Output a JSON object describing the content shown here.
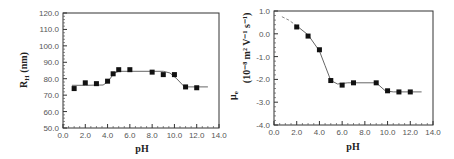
{
  "chart_data": [
    {
      "type": "scatter",
      "title": "",
      "xlabel": "pH",
      "ylabel": "R_H (nm)",
      "xlim": [
        0.0,
        14.0
      ],
      "ylim": [
        50.0,
        120.0
      ],
      "xticks": [
        "0.0",
        "2.0",
        "4.0",
        "6.0",
        "8.0",
        "10.0",
        "12.0",
        "14.0"
      ],
      "yticks": [
        "50.0",
        "60.0",
        "70.0",
        "80.0",
        "90.0",
        "100.0",
        "110.0",
        "120.0"
      ],
      "grid": false,
      "legend": null,
      "series": [
        {
          "name": "data",
          "marker": "filled-square",
          "x": [
            1.0,
            2.0,
            3.0,
            4.0,
            4.5,
            5.0,
            6.0,
            8.0,
            9.0,
            10.0,
            11.0,
            12.0
          ],
          "y": [
            74.0,
            77.5,
            77.0,
            78.5,
            83.0,
            85.5,
            85.5,
            84.0,
            82.5,
            82.5,
            75.0,
            74.5
          ]
        },
        {
          "name": "fit",
          "style": "line",
          "x": [
            0.8,
            2.0,
            3.6,
            4.0,
            4.6,
            5.0,
            9.0,
            9.6,
            10.2,
            10.9,
            13.0
          ],
          "y": [
            76.0,
            76.0,
            76.2,
            78.0,
            83.5,
            84.5,
            84.5,
            83.5,
            80.0,
            75.0,
            75.0
          ]
        }
      ]
    },
    {
      "type": "scatter",
      "title": "",
      "xlabel": "pH",
      "ylabel": "μe (10^-8 m^2 V^-1 s^-1)",
      "xlim": [
        0.0,
        14.0
      ],
      "ylim": [
        -4.0,
        1.0
      ],
      "xticks": [
        "0.0",
        "2.0",
        "4.0",
        "6.0",
        "8.0",
        "10.0",
        "12.0",
        "14.0"
      ],
      "yticks": [
        "-4.0",
        "-3.0",
        "-2.0",
        "-1.0",
        "0.0",
        "1.0"
      ],
      "grid": false,
      "legend": null,
      "series": [
        {
          "name": "data",
          "marker": "filled-square",
          "x": [
            2.0,
            3.0,
            4.0,
            5.0,
            6.0,
            7.0,
            9.0,
            10.0,
            11.0,
            12.0
          ],
          "y": [
            0.3,
            -0.1,
            -0.7,
            -2.05,
            -2.25,
            -2.15,
            -2.15,
            -2.5,
            -2.55,
            -2.55
          ]
        },
        {
          "name": "fit-extrapolated",
          "style": "dashed",
          "x": [
            0.7,
            1.3,
            2.0
          ],
          "y": [
            0.75,
            0.6,
            0.35
          ]
        },
        {
          "name": "fit",
          "style": "line",
          "x": [
            2.0,
            3.0,
            4.0,
            4.5,
            5.0,
            5.6,
            6.5,
            9.0,
            9.8,
            10.5,
            13.0
          ],
          "y": [
            0.35,
            -0.05,
            -0.75,
            -1.4,
            -2.05,
            -2.2,
            -2.15,
            -2.15,
            -2.5,
            -2.55,
            -2.55
          ]
        }
      ]
    }
  ],
  "charts": {
    "left": {
      "xlabel": "pH",
      "ylabel_main": "R",
      "ylabel_sub": "H",
      "ylabel_unit": " (nm)",
      "xticks": [
        "0.0",
        "2.0",
        "4.0",
        "6.0",
        "8.0",
        "10.0",
        "12.0",
        "14.0"
      ],
      "yticks": [
        "50.0",
        "60.0",
        "70.0",
        "80.0",
        "90.0",
        "100.0",
        "110.0",
        "120.0"
      ]
    },
    "right": {
      "xlabel": "pH",
      "ylabel_symbol": "μ",
      "ylabel_sub": "e",
      "ylabel_unit": "(10⁻⁸ m² V⁻¹ s⁻¹)",
      "xticks": [
        "0.0",
        "2.0",
        "4.0",
        "6.0",
        "8.0",
        "10.0",
        "12.0",
        "14.0"
      ],
      "yticks": [
        "-4.0",
        "-3.0",
        "-2.0",
        "-1.0",
        "0.0",
        "1.0"
      ]
    }
  },
  "colors": {
    "axis": "#333333",
    "marker": "#111111",
    "fit_line": "#666666",
    "tick_text": "#555555"
  }
}
